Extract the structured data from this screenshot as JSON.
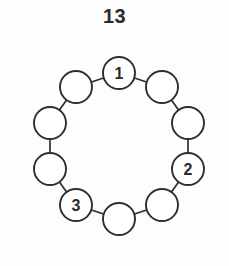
{
  "figure": {
    "title": "13",
    "background_color": "#fdfdfc",
    "stroke_color": "#2e2e2e",
    "node_fill_color": "#ffffff",
    "label_color": "#2b2b2b"
  },
  "chart_data": {
    "type": "diagram",
    "diagram_kind": "cycle-graph",
    "title": "13",
    "node_count": 10,
    "edge_count": 10,
    "ring": {
      "center_x": 119,
      "center_y": 146,
      "radius": 73,
      "node_radius": 16
    },
    "nodes": [
      {
        "id": 0,
        "label": "1",
        "labeled": true,
        "angle_deg": -90,
        "cx": 119,
        "cy": 73
      },
      {
        "id": 1,
        "label": "",
        "labeled": false,
        "angle_deg": -54,
        "cx": 162,
        "cy": 87
      },
      {
        "id": 2,
        "label": "",
        "labeled": false,
        "angle_deg": -18,
        "cx": 188,
        "cy": 123
      },
      {
        "id": 3,
        "label": "2",
        "labeled": true,
        "angle_deg": 18,
        "cx": 188,
        "cy": 169
      },
      {
        "id": 4,
        "label": "",
        "labeled": false,
        "angle_deg": 54,
        "cx": 162,
        "cy": 205
      },
      {
        "id": 5,
        "label": "",
        "labeled": false,
        "angle_deg": 90,
        "cx": 119,
        "cy": 219
      },
      {
        "id": 6,
        "label": "3",
        "labeled": true,
        "angle_deg": 126,
        "cx": 76,
        "cy": 205
      },
      {
        "id": 7,
        "label": "",
        "labeled": false,
        "angle_deg": 162,
        "cx": 50,
        "cy": 169
      },
      {
        "id": 8,
        "label": "",
        "labeled": false,
        "angle_deg": 198,
        "cx": 50,
        "cy": 123
      },
      {
        "id": 9,
        "label": "",
        "labeled": false,
        "angle_deg": 234,
        "cx": 76,
        "cy": 87
      }
    ],
    "edges": [
      {
        "from": 0,
        "to": 1
      },
      {
        "from": 1,
        "to": 2
      },
      {
        "from": 2,
        "to": 3
      },
      {
        "from": 3,
        "to": 4
      },
      {
        "from": 4,
        "to": 5
      },
      {
        "from": 5,
        "to": 6
      },
      {
        "from": 6,
        "to": 7
      },
      {
        "from": 7,
        "to": 8
      },
      {
        "from": 8,
        "to": 9
      },
      {
        "from": 9,
        "to": 0
      }
    ],
    "labels": [
      "1",
      "2",
      "3"
    ]
  }
}
